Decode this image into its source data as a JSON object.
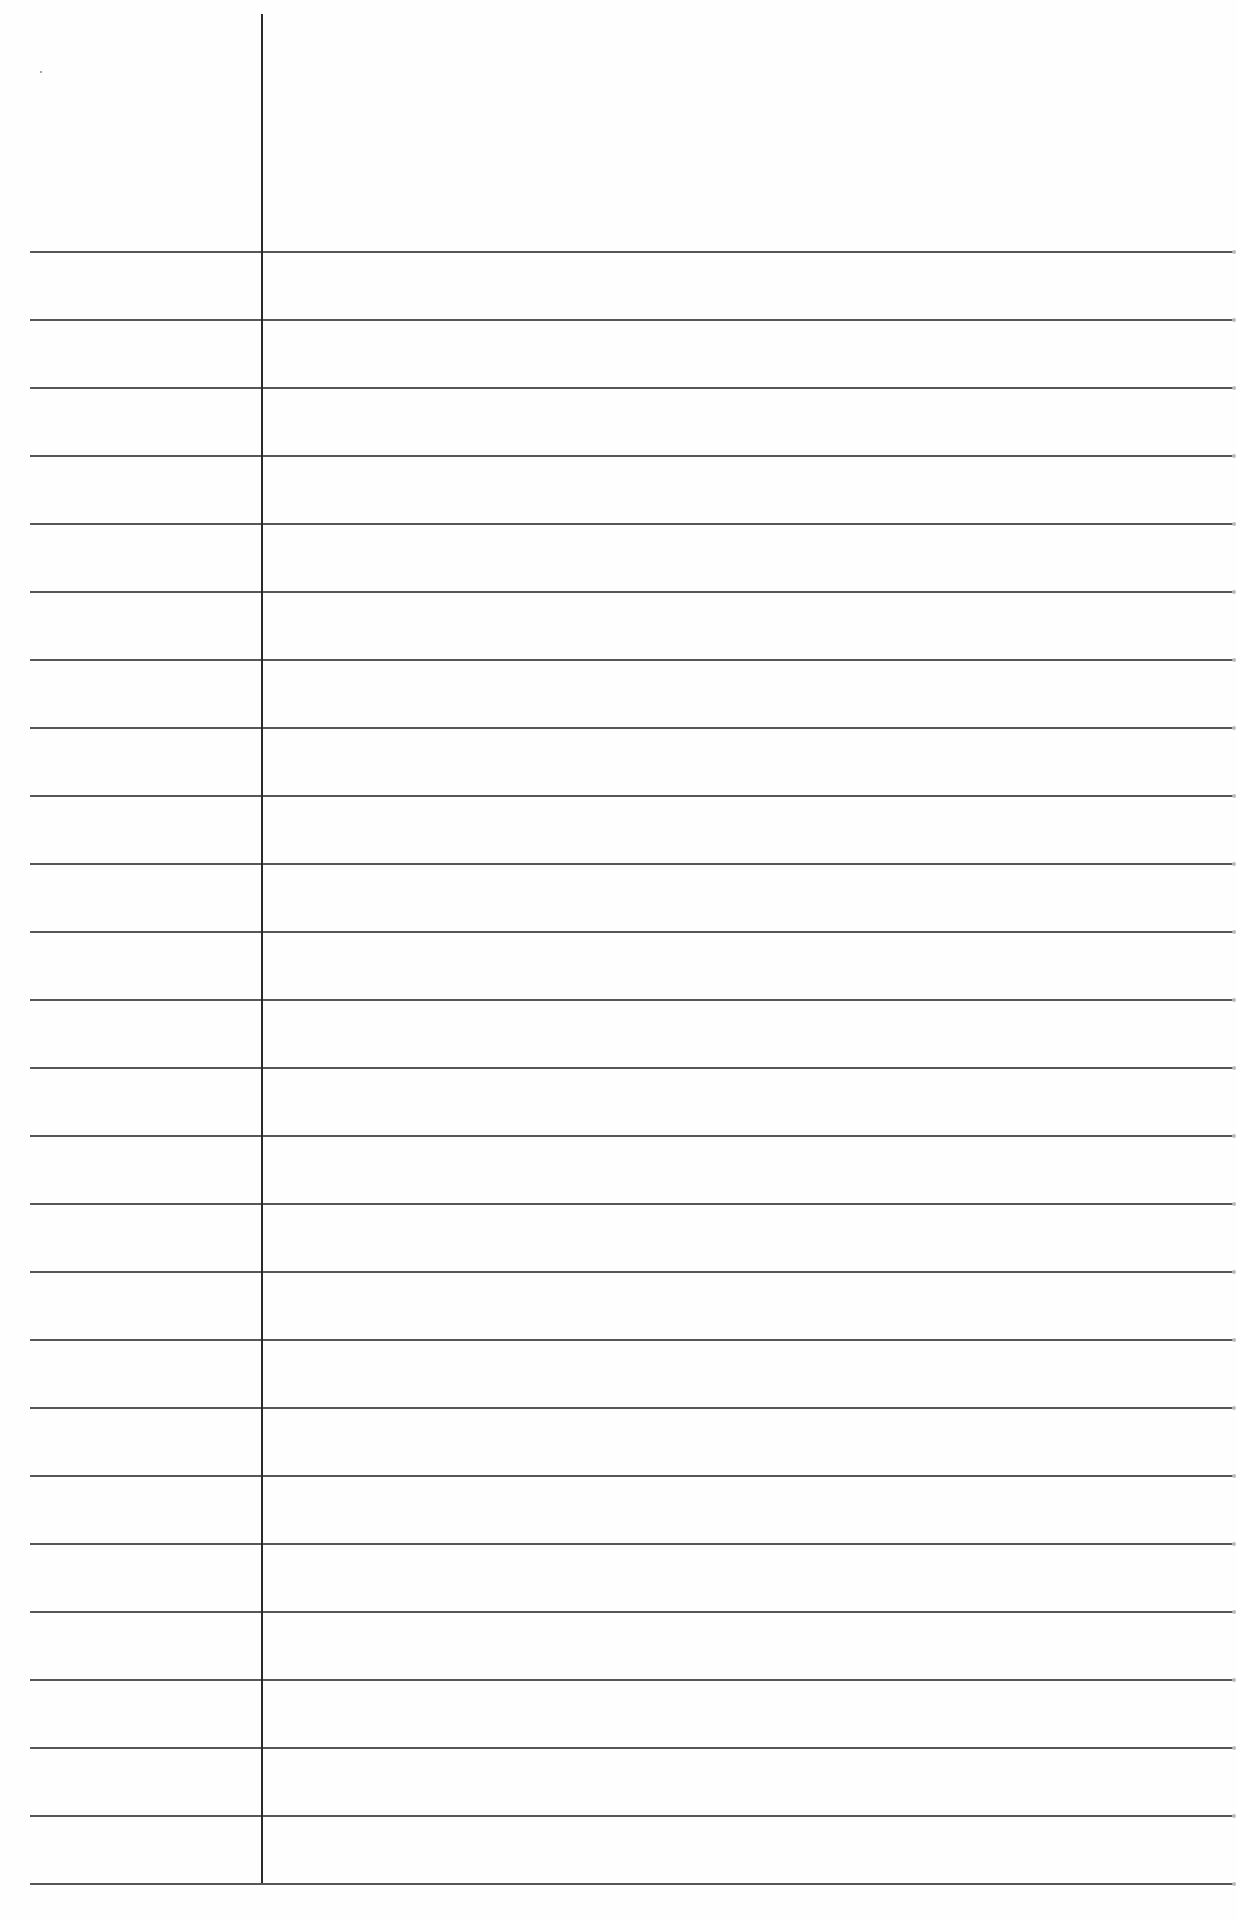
{
  "page": {
    "type": "lined-paper",
    "background": "#fefefe",
    "line_color": "#3a3a3a",
    "margin_line_color": "#2a2a2a"
  },
  "margin_line": {
    "x": 261,
    "top": 14,
    "bottom": 1883
  },
  "ruled_lines": {
    "left": 30,
    "right": 1233,
    "first_y": 251,
    "spacing": 68.0,
    "count": 25
  },
  "text": []
}
